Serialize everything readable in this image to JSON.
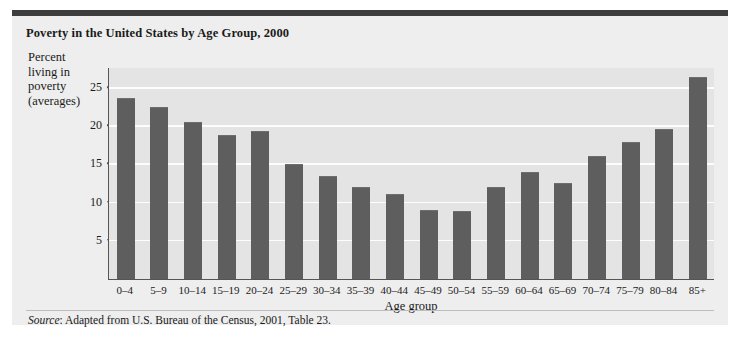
{
  "figure": {
    "title": "Poverty in the United States by Age Group, 2000",
    "source_lead": "Source",
    "source_text": ": Adapted from U.S. Bureau of the Census, 2001, Table 23."
  },
  "y_axis_title_lines": [
    "Percent",
    "living in",
    "poverty",
    "(averages)"
  ],
  "colors": {
    "bar": "#5e5e5e",
    "plot_background": "#e4e4e4",
    "card_background": "#eeeeee",
    "header_rule": "#3d3d3d",
    "gridline": "#fdfdfd",
    "axis": "#555555"
  },
  "chart_data": {
    "type": "bar",
    "title": "Poverty in the United States by Age Group, 2000",
    "xlabel": "Age group",
    "ylabel": "Percent living in poverty (averages)",
    "ylim": [
      0,
      27.5
    ],
    "yticks": [
      5,
      10,
      15,
      20,
      25
    ],
    "grid": true,
    "legend": "none",
    "categories": [
      "0–4",
      "5–9",
      "10–14",
      "15–19",
      "20–24",
      "25–29",
      "30–34",
      "35–39",
      "40–44",
      "45–49",
      "50–54",
      "55–59",
      "60–64",
      "65–69",
      "70–74",
      "75–79",
      "80–84",
      "85+"
    ],
    "values": [
      23.7,
      22.5,
      20.6,
      18.8,
      19.4,
      15.0,
      13.5,
      12.1,
      11.1,
      9.1,
      8.9,
      12.1,
      14.0,
      12.6,
      16.1,
      18.0,
      19.6,
      26.4
    ]
  }
}
